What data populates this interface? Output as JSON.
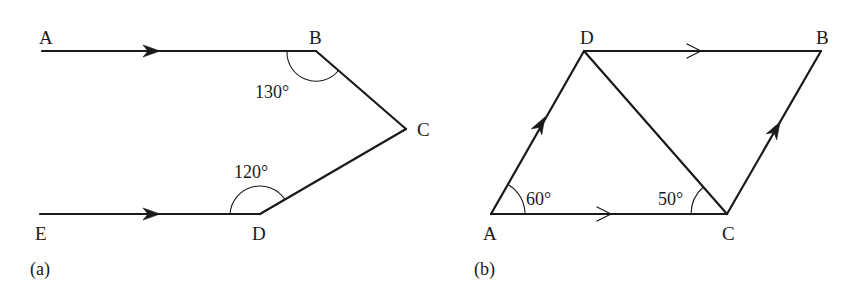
{
  "figures": [
    {
      "id": "a",
      "caption": "(a)",
      "points": {
        "A": {
          "label": "A",
          "x": 42,
          "y": 51
        },
        "B": {
          "label": "B",
          "x": 316,
          "y": 51
        },
        "C": {
          "label": "C",
          "x": 406,
          "y": 129
        },
        "D": {
          "label": "D",
          "x": 260,
          "y": 214
        },
        "E": {
          "label": "E",
          "x": 40,
          "y": 214
        }
      },
      "segments": [
        {
          "from": "A",
          "to": "B",
          "arrow": "filled"
        },
        {
          "from": "B",
          "to": "C",
          "arrow": "none"
        },
        {
          "from": "C",
          "to": "D",
          "arrow": "none"
        },
        {
          "from": "E",
          "to": "D",
          "arrow": "filled"
        }
      ],
      "angles": [
        {
          "vertex": "B",
          "label": "130°",
          "value": 130
        },
        {
          "vertex": "D",
          "label": "120°",
          "value": 120
        }
      ]
    },
    {
      "id": "b",
      "caption": "(b)",
      "points": {
        "A": {
          "label": "A",
          "x": 491,
          "y": 214
        },
        "B": {
          "label": "B",
          "x": 821,
          "y": 51
        },
        "C": {
          "label": "C",
          "x": 727,
          "y": 214
        },
        "D": {
          "label": "D",
          "x": 584,
          "y": 51
        }
      },
      "segments": [
        {
          "from": "D",
          "to": "B",
          "arrow": "open"
        },
        {
          "from": "A",
          "to": "C",
          "arrow": "open"
        },
        {
          "from": "A",
          "to": "D",
          "arrow": "filled"
        },
        {
          "from": "C",
          "to": "B",
          "arrow": "filled"
        },
        {
          "from": "D",
          "to": "C",
          "arrow": "none"
        }
      ],
      "angles": [
        {
          "vertex": "A",
          "label": "60°",
          "value": 60
        },
        {
          "vertex": "C",
          "label": "50°",
          "value": 50
        }
      ]
    }
  ],
  "colors": {
    "ink": "#1a1a1a",
    "background": "#ffffff"
  }
}
